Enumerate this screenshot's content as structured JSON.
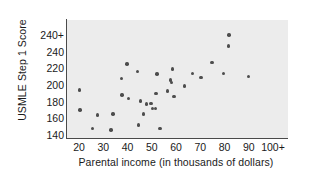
{
  "chart_data": {
    "type": "scatter",
    "title": "",
    "xlabel": "Parental income (in thousands of dollars)",
    "ylabel": "USMLE Step 1 Score",
    "xtick_labels": [
      "20",
      "30",
      "40",
      "50",
      "60",
      "70",
      "80",
      "90",
      "100+"
    ],
    "xtick_values": [
      20,
      30,
      40,
      50,
      60,
      70,
      80,
      90,
      100
    ],
    "ytick_labels": [
      "140",
      "160",
      "180",
      "200",
      "220",
      "240",
      "240+"
    ],
    "ytick_values": [
      140,
      160,
      180,
      200,
      220,
      240,
      260
    ],
    "xlim": [
      15,
      105
    ],
    "ylim": [
      133,
      268
    ],
    "grid": false,
    "legend": null,
    "marker": "filled-circle",
    "marker_color": "#4d4d4d",
    "panel_color": "#ececec",
    "axis_color": "#4a4a4a",
    "points": [
      {
        "x": 20.3,
        "y": 194
      },
      {
        "x": 20.4,
        "y": 170
      },
      {
        "x": 25.5,
        "y": 148
      },
      {
        "x": 27.6,
        "y": 164
      },
      {
        "x": 33.2,
        "y": 146
      },
      {
        "x": 34.0,
        "y": 165
      },
      {
        "x": 37.6,
        "y": 208
      },
      {
        "x": 37.8,
        "y": 188
      },
      {
        "x": 39.8,
        "y": 225
      },
      {
        "x": 40.4,
        "y": 184
      },
      {
        "x": 44.1,
        "y": 216
      },
      {
        "x": 44.6,
        "y": 152
      },
      {
        "x": 45.4,
        "y": 181
      },
      {
        "x": 46.6,
        "y": 165
      },
      {
        "x": 47.9,
        "y": 177
      },
      {
        "x": 49.7,
        "y": 178
      },
      {
        "x": 50.4,
        "y": 172
      },
      {
        "x": 51.6,
        "y": 172
      },
      {
        "x": 51.8,
        "y": 190
      },
      {
        "x": 52.1,
        "y": 213
      },
      {
        "x": 53.4,
        "y": 148
      },
      {
        "x": 56.4,
        "y": 193
      },
      {
        "x": 57.8,
        "y": 206
      },
      {
        "x": 58.2,
        "y": 203
      },
      {
        "x": 58.6,
        "y": 219
      },
      {
        "x": 59.1,
        "y": 186
      },
      {
        "x": 63.6,
        "y": 199
      },
      {
        "x": 66.8,
        "y": 214
      },
      {
        "x": 70.3,
        "y": 209
      },
      {
        "x": 74.9,
        "y": 227
      },
      {
        "x": 79.7,
        "y": 214
      },
      {
        "x": 81.6,
        "y": 247
      },
      {
        "x": 81.8,
        "y": 260
      },
      {
        "x": 90.0,
        "y": 210
      }
    ]
  }
}
